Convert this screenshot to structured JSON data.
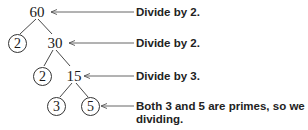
{
  "diagram": {
    "type": "factor-tree",
    "nodes": {
      "root": "60",
      "level1_left": "2",
      "level1_right": "30",
      "level2_left": "2",
      "level2_right": "15",
      "level3_left": "3",
      "level3_right": "5"
    },
    "annotations": [
      {
        "text": "Divide by 2.",
        "points_to": "60"
      },
      {
        "text": "Divide by 2.",
        "points_to": "30"
      },
      {
        "text": "Divide by 3.",
        "points_to": "15"
      },
      {
        "text_line1": "Both 3 and 5 are primes, so we stop",
        "text_line2": "dividing.",
        "points_to": "5"
      }
    ],
    "colors": {
      "ink": "#1a1a1a",
      "arrow": "#555555"
    }
  }
}
